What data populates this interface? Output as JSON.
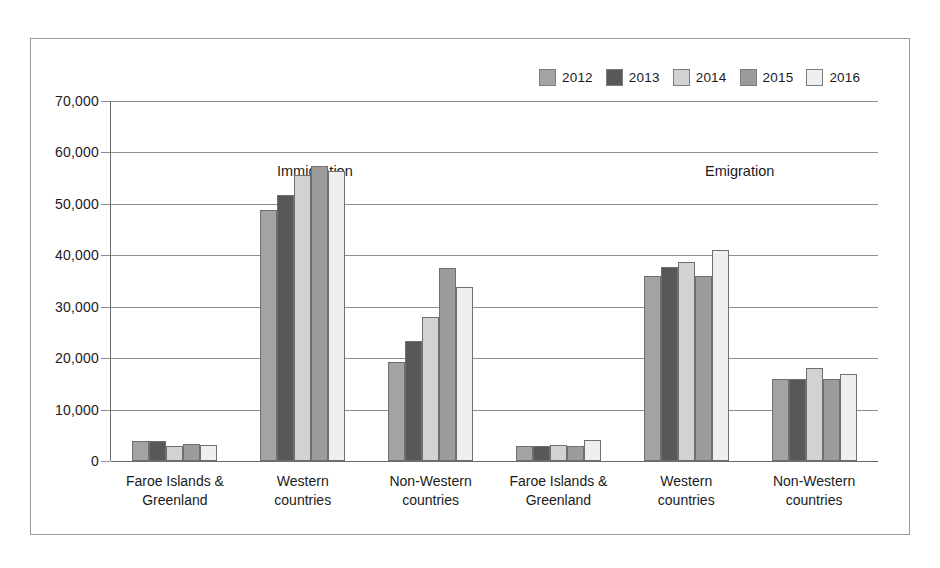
{
  "chart_data": {
    "type": "bar",
    "title": "",
    "subtitle": "",
    "xlabel": "",
    "ylabel": "",
    "ylim": [
      0,
      70000
    ],
    "ytick_labels": [
      "0",
      "10,000",
      "20,000",
      "30,000",
      "40,000",
      "50,000",
      "60,000",
      "70,000"
    ],
    "ytick_values": [
      0,
      10000,
      20000,
      30000,
      40000,
      50000,
      60000,
      70000
    ],
    "grid": true,
    "legend_position": "top-right",
    "legend_entries": [
      "2012",
      "2013",
      "2014",
      "2015",
      "2016"
    ],
    "series": [
      {
        "name": "2012",
        "color": "#a3a3a3",
        "values": [
          3900,
          48800,
          19300,
          3000,
          36000,
          15900
        ]
      },
      {
        "name": "2013",
        "color": "#585858",
        "values": [
          3900,
          51800,
          23400,
          3000,
          37800,
          16000
        ]
      },
      {
        "name": "2014",
        "color": "#d2d2d2",
        "values": [
          2900,
          55600,
          28000,
          3100,
          38700,
          18000
        ]
      },
      {
        "name": "2015",
        "color": "#9b9b9b",
        "values": [
          3300,
          57400,
          37600,
          3000,
          36000,
          15900
        ]
      },
      {
        "name": "2016",
        "color": "#efefef",
        "values": [
          3100,
          56400,
          33900,
          4100,
          41000,
          17000
        ]
      }
    ],
    "panels": [
      {
        "label": "Immigration",
        "categories": [
          "Faroe Islands &\nGreenland",
          "Western\ncountries",
          "Non-Western\ncountries"
        ]
      },
      {
        "label": "Emigration",
        "categories": [
          "Faroe Islands &\nGreenland",
          "Western\ncountries",
          "Non-Western\ncountries"
        ]
      }
    ],
    "categories": [
      "Immigration / Faroe Islands & Greenland",
      "Immigration / Western countries",
      "Immigration / Non-Western countries",
      "Emigration / Faroe Islands & Greenland",
      "Emigration / Western countries",
      "Emigration / Non-Western countries"
    ]
  }
}
